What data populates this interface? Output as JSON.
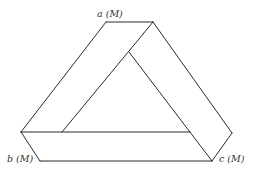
{
  "diagram": {
    "stroke_color": "#2a2a2a",
    "labels": {
      "a": "a (M)",
      "b": "b (M)",
      "c": "c (M)"
    },
    "vertices": {
      "top_left": [
        106,
        22
      ],
      "top_right": [
        153,
        22
      ],
      "inner_top": [
        129,
        52
      ],
      "left_outer": [
        21,
        132
      ],
      "inner_left": [
        62,
        132
      ],
      "inner_right": [
        190,
        132
      ],
      "right_outer": [
        232,
        133
      ],
      "bottom_left": [
        40,
        161
      ],
      "bottom_right": [
        212,
        161
      ]
    }
  }
}
